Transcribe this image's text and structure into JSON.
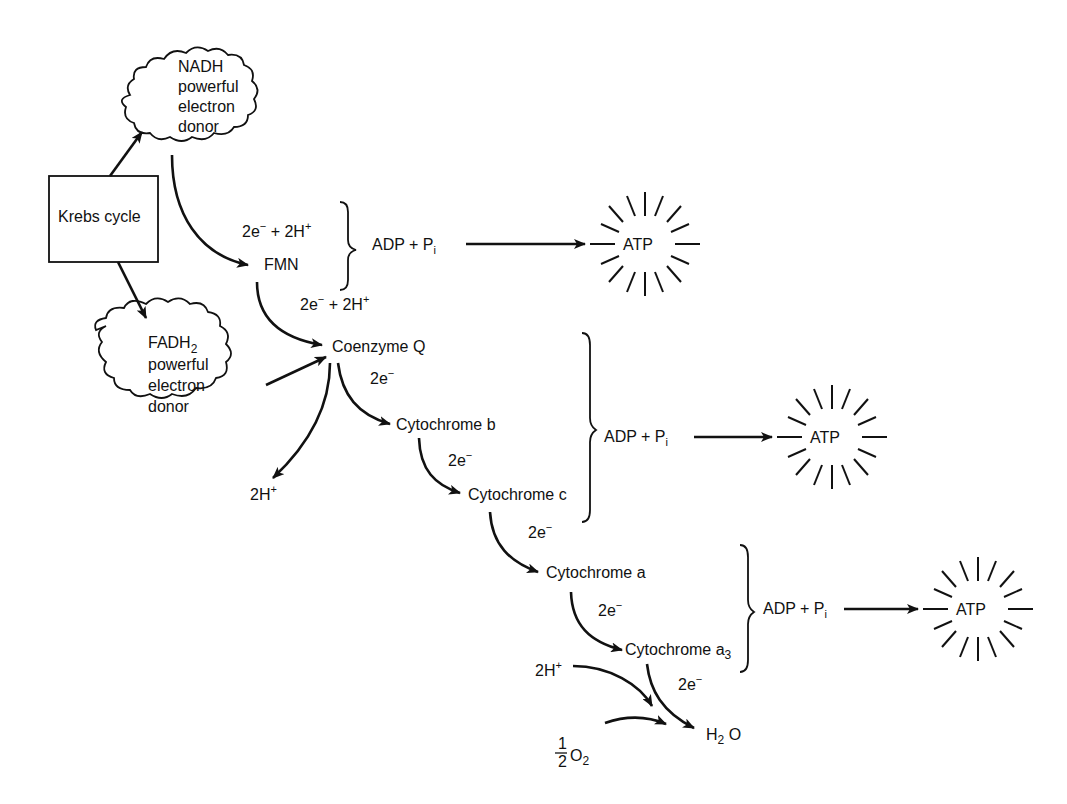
{
  "diagram": {
    "type": "flow",
    "colors": {
      "ink": "#111111",
      "background": "#ffffff"
    },
    "nodes": {
      "krebs": "Krebs cycle",
      "nadh": {
        "line1": "NADH",
        "line2": "powerful",
        "line3": "electron",
        "line4": "donor"
      },
      "fadh2": {
        "line1": "FADH",
        "sub": "2",
        "line2": "powerful",
        "line3": "electron",
        "line4": "donor"
      },
      "fmn": "FMN",
      "coq": "Coenzyme  Q",
      "cyt_b": "Cytochrome b",
      "cyt_c": "Cytochrome c",
      "cyt_a": "Cytochrome a",
      "cyt_a3": {
        "text": "Cytochrome a",
        "sub": "3"
      },
      "h2o": {
        "h": "H",
        "sub": "2",
        "o": " O"
      },
      "half_o2": {
        "num": "1",
        "den": "2",
        "o": "O",
        "sub": "2"
      },
      "h_plus_out": {
        "text": "2H",
        "sup": "+"
      },
      "h_plus_in": {
        "text": "2H",
        "sup": "+"
      }
    },
    "edge_labels": {
      "nadh_to_fmn": {
        "a": "2e",
        "sup1": "−",
        "b": " + 2H",
        "sup2": "+"
      },
      "fmn_to_coq": {
        "a": "2e",
        "sup1": "−",
        "b": "  + 2H",
        "sup2": "+"
      },
      "coq_to_b": {
        "a": "2e",
        "sup1": "−"
      },
      "b_to_c": {
        "a": "2e",
        "sup1": "−"
      },
      "c_to_a": {
        "a": "2e",
        "sup1": "−"
      },
      "a_to_a3": {
        "a": "2e",
        "sup1": "−"
      },
      "a3_to_h2o": {
        "a": "2e",
        "sup1": "−"
      }
    },
    "phosphorylation_sites": [
      {
        "reactant": "ADP + P",
        "sub": "i",
        "product": "ATP"
      },
      {
        "reactant": "ADP + P",
        "sub": "i",
        "product": "ATP"
      },
      {
        "reactant": "ADP + P",
        "sub": "i",
        "product": "ATP"
      }
    ]
  }
}
